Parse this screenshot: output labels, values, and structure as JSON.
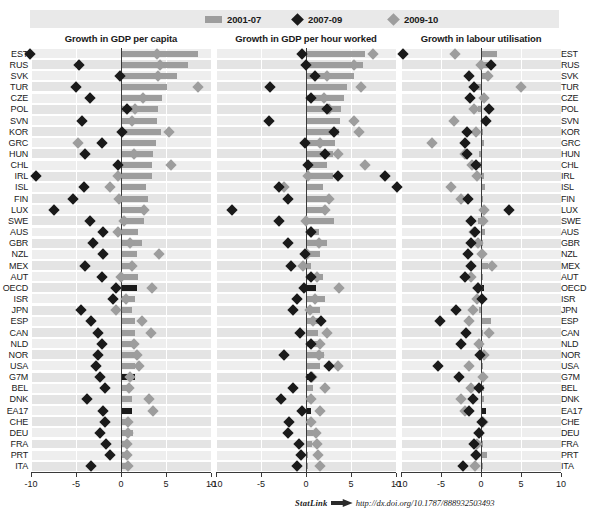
{
  "legend": {
    "items": [
      {
        "label": "2001-07",
        "marker": "bar",
        "color": "#9d9d9d"
      },
      {
        "label": "2007-09",
        "marker": "diamond-black",
        "color": "#1a1a1a"
      },
      {
        "label": "2009-10",
        "marker": "diamond-grey",
        "color": "#9d9d9d"
      }
    ]
  },
  "footer": {
    "statlink_label": "StatLink",
    "icon": "statlink-arrow-icon",
    "url": "http://dx.doi.org/10.1787/888932503493"
  },
  "chart_data": {
    "type": "bar",
    "title": "",
    "xlabel": "",
    "ylabel": "",
    "xlim": [
      -10,
      10
    ],
    "xticks": [
      -10,
      -5,
      0,
      5,
      10
    ],
    "xtick_labels": [
      "-10",
      "-5",
      "0",
      "5",
      "10"
    ],
    "grid": true,
    "legend_position": "top",
    "categories": [
      "EST",
      "RUS",
      "SVK",
      "TUR",
      "CZE",
      "POL",
      "SVN",
      "KOR",
      "GRC",
      "HUN",
      "CHL",
      "IRL",
      "ISL",
      "FIN",
      "LUX",
      "SWE",
      "AUS",
      "GBR",
      "NZL",
      "MEX",
      "AUT",
      "OECD",
      "ISR",
      "JPN",
      "ESP",
      "CAN",
      "NLD",
      "NOR",
      "USA",
      "G7M",
      "BEL",
      "DNK",
      "EA17",
      "CHE",
      "DEU",
      "FRA",
      "PRT",
      "ITA"
    ],
    "highlight_categories": [
      "OECD",
      "G7M",
      "EA17"
    ],
    "panels": [
      {
        "title": "Growth in GDP per capita",
        "series": [
          {
            "name": "2001-07",
            "type": "bar",
            "values": [
              8.5,
              7.4,
              6.2,
              5.1,
              4.5,
              4.1,
              4.0,
              4.4,
              3.9,
              3.6,
              3.4,
              3.4,
              2.8,
              3.0,
              2.4,
              2.6,
              1.9,
              2.3,
              1.8,
              1.5,
              1.9,
              1.8,
              1.6,
              1.2,
              1.6,
              1.6,
              1.3,
              1.5,
              1.6,
              1.5,
              1.2,
              1.2,
              1.2,
              1.0,
              1.3,
              0.9,
              0.9,
              0.5
            ]
          },
          {
            "name": "2007-09",
            "type": "diamond",
            "values": [
              -10.1,
              -4.7,
              -0.1,
              -5.0,
              -3.4,
              0.7,
              -4.3,
              0.1,
              -2.1,
              -4.0,
              -0.3,
              -9.4,
              -4.1,
              -5.3,
              -7.4,
              -3.5,
              -2.0,
              -3.1,
              -2.0,
              -4.0,
              -2.1,
              -0.6,
              -0.9,
              -4.5,
              -3.3,
              -2.6,
              -2.1,
              -2.6,
              -2.8,
              -2.3,
              -1.8,
              -3.8,
              -2.0,
              -1.8,
              -2.3,
              -1.7,
              -1.2,
              -3.3
            ]
          },
          {
            "name": "2009-10",
            "type": "diamond",
            "values": [
              4.0,
              4.3,
              4.1,
              8.5,
              2.4,
              1.6,
              1.2,
              5.3,
              -4.8,
              1.4,
              5.5,
              -0.3,
              -1.2,
              -0.2,
              2.6,
              0.3,
              -0.3,
              1.0,
              4.2,
              1.2,
              0.0,
              3.4,
              0.5,
              -0.6,
              2.3,
              3.3,
              1.4,
              1.8,
              2.0,
              1.0,
              0.9,
              3.1,
              3.6,
              0.8,
              0.8,
              0.7,
              0.7,
              0.8
            ]
          }
        ]
      },
      {
        "title": "Growth in GDP per hour worked",
        "series": [
          {
            "name": "2001-07",
            "type": "bar",
            "values": [
              6.5,
              6.3,
              5.3,
              4.6,
              4.2,
              3.9,
              3.8,
              3.7,
              3.2,
              3.0,
              2.3,
              3.0,
              1.9,
              2.7,
              2.2,
              3.1,
              1.4,
              2.3,
              1.6,
              0.6,
              1.9,
              1.1,
              2.1,
              1.5,
              1.5,
              1.3,
              1.3,
              2.0,
              1.5,
              1.0,
              0.8,
              0.9,
              0.6,
              0.7,
              0.8,
              0.7,
              0.2,
              0.2
            ]
          },
          {
            "name": "2007-09",
            "type": "diamond",
            "values": [
              -0.4,
              0.0,
              1.0,
              -4.0,
              0.5,
              2.3,
              -4.1,
              3.1,
              -0.1,
              2.1,
              0.2,
              3.5,
              -3.0,
              -2.0,
              -8.2,
              -3.0,
              0.6,
              -2.0,
              -0.1,
              -1.7,
              0.5,
              -0.2,
              -1.0,
              -1.4,
              1.7,
              -0.7,
              0.5,
              -2.5,
              2.6,
              0.5,
              -1.5,
              -2.8,
              -0.5,
              -1.9,
              -2.0,
              -0.8,
              -0.6,
              -1.0
            ]
          },
          {
            "name": "2009-10",
            "type": "diamond",
            "values": [
              7.4,
              5.3,
              2.3,
              6.1,
              2.0,
              2.6,
              5.3,
              5.9,
              1.5,
              3.5,
              6.5,
              0.2,
              -2.5,
              2.5,
              2.1,
              0.0,
              0.6,
              1.4,
              0.1,
              -0.3,
              1.2,
              3.7,
              1.0,
              0.4,
              0.8,
              2.3,
              1.6,
              1.4,
              3.5,
              0.7,
              2.1,
              0.5,
              1.6,
              0.6,
              1.1,
              1.2,
              1.3,
              1.6
            ]
          }
        ]
      },
      {
        "title": "Growth in labour utilisation",
        "series": [
          {
            "name": "2001-07",
            "type": "bar",
            "values": [
              2.0,
              1.6,
              0.7,
              -0.6,
              0.4,
              -0.4,
              0.8,
              0.3,
              0.4,
              -0.3,
              -0.4,
              0.4,
              0.5,
              0.3,
              0.1,
              -0.4,
              0.5,
              0.0,
              0.2,
              0.9,
              0.0,
              0.4,
              -0.4,
              -0.3,
              1.3,
              0.3,
              0.1,
              -0.4,
              0.1,
              0.3,
              0.4,
              0.4,
              0.6,
              0.3,
              0.3,
              0.1,
              0.7,
              0.3
            ]
          },
          {
            "name": "2007-09",
            "type": "diamond",
            "values": [
              -9.7,
              1.2,
              -1.5,
              -0.9,
              -1.4,
              1.0,
              0.6,
              -1.8,
              -2.0,
              -1.8,
              -0.6,
              -12.0,
              -10.5,
              -1.6,
              3.5,
              -1.2,
              -0.7,
              -1.2,
              -1.6,
              -1.2,
              -2.0,
              -0.4,
              0.1,
              -3.1,
              -5.1,
              -1.9,
              -2.5,
              -0.1,
              -5.4,
              -2.8,
              -0.3,
              -1.0,
              -1.5,
              0.1,
              -0.3,
              -0.9,
              -0.6,
              -2.3
            ]
          },
          {
            "name": "2009-10",
            "type": "diamond",
            "values": [
              -3.2,
              0.0,
              0.9,
              5.0,
              0.4,
              -0.9,
              -3.4,
              -0.6,
              -6.1,
              -2.0,
              -1.1,
              -0.5,
              -3.7,
              -2.5,
              0.4,
              0.3,
              -0.9,
              -0.4,
              0.1,
              1.4,
              -1.2,
              -0.4,
              -0.5,
              -1.0,
              -1.5,
              1.0,
              -0.2,
              0.4,
              -1.5,
              0.3,
              -1.2,
              -2.5,
              -2.0,
              0.2,
              -0.3,
              -0.5,
              -0.6,
              -0.8
            ]
          }
        ]
      }
    ]
  }
}
